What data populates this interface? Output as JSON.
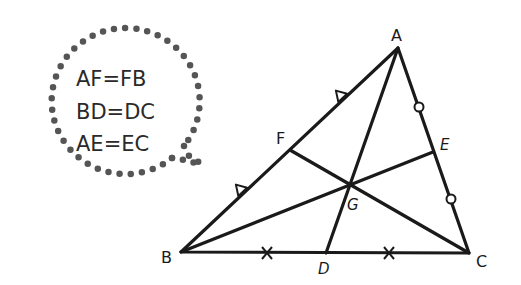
{
  "bubble": {
    "lines": [
      "AF=FB",
      "BD=DC",
      "AE=EC"
    ],
    "dot_color": "#555555",
    "text_color": "#2a2a2a"
  },
  "diagram": {
    "stroke_color": "#1a1a1a",
    "vertices": {
      "A": {
        "label": "A",
        "x": 398,
        "y": 48
      },
      "B": {
        "label": "B",
        "x": 181,
        "y": 252
      },
      "C": {
        "label": "C",
        "x": 469,
        "y": 253
      }
    },
    "midpoints": {
      "F": {
        "label": "F",
        "x": 290,
        "y": 150
      },
      "D": {
        "label": "D",
        "x": 326,
        "y": 253
      },
      "E": {
        "label": "E",
        "x": 433,
        "y": 152
      }
    },
    "centroid": {
      "label": "G",
      "x": 347,
      "y": 185
    },
    "markers": {
      "AB": "triangle",
      "BC": "cross",
      "AC": "circle"
    }
  }
}
